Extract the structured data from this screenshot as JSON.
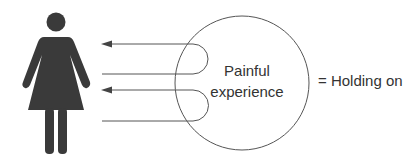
{
  "diagram": {
    "circle_label_line1": "Painful",
    "circle_label_line2": "experience",
    "equation_label": "= Holding on",
    "figure": "woman-figure-icon",
    "colors": {
      "figure": "#3a3a3a",
      "lines": "#555555",
      "text": "#333333",
      "background": "#ffffff"
    }
  }
}
